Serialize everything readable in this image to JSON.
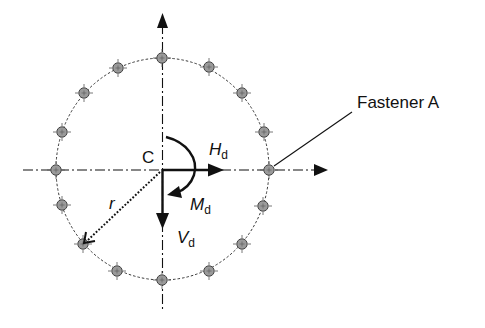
{
  "diagram": {
    "title": "",
    "center": {
      "label": "C",
      "x": 162.5,
      "y": 169.5
    },
    "bolt_circle": {
      "rx": 106.5,
      "ry": 111,
      "style": "dashed"
    },
    "radius_label": "r",
    "fastener_count": 16,
    "fasteners": [
      {
        "x": 162,
        "y": 58
      },
      {
        "x": 209,
        "y": 67
      },
      {
        "x": 242,
        "y": 93
      },
      {
        "x": 264,
        "y": 132
      },
      {
        "x": 269,
        "y": 170
      },
      {
        "x": 263,
        "y": 206
      },
      {
        "x": 242,
        "y": 244
      },
      {
        "x": 209,
        "y": 271
      },
      {
        "x": 162,
        "y": 280
      },
      {
        "x": 117,
        "y": 271
      },
      {
        "x": 83,
        "y": 244
      },
      {
        "x": 62,
        "y": 205
      },
      {
        "x": 56,
        "y": 170
      },
      {
        "x": 62,
        "y": 132
      },
      {
        "x": 84,
        "y": 93
      },
      {
        "x": 118,
        "y": 68
      }
    ],
    "forces": {
      "horizontal": {
        "symbol": "H",
        "subscript": "d"
      },
      "vertical": {
        "symbol": "V",
        "subscript": "d"
      },
      "moment": {
        "symbol": "M",
        "subscript": "d"
      }
    },
    "callout": {
      "label": "Fastener A",
      "target_index": 4
    },
    "colors": {
      "line": "#111111",
      "fastener_fill": "#9a9a9a",
      "fastener_stroke": "#444444",
      "background": "#ffffff"
    }
  }
}
